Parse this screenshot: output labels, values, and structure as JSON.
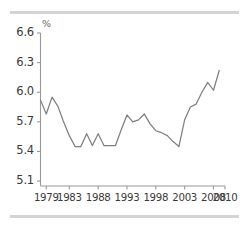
{
  "chart_data": {
    "type": "line",
    "title": "",
    "subtitle": "",
    "xlabel": "",
    "ylabel": "",
    "unit_label": "%",
    "grid": false,
    "legend": "none",
    "xlim": [
      1978,
      2010
    ],
    "ylim": [
      5.05,
      6.6
    ],
    "ytick_labels": [
      "6.6",
      "6.3",
      "6.0",
      "5.7",
      "5.4",
      "5.1"
    ],
    "ytick_values": [
      6.6,
      6.3,
      6.0,
      5.7,
      5.4,
      5.1
    ],
    "xtick_labels": [
      "1979",
      "1983",
      "1988",
      "1993",
      "1998",
      "2003",
      "2008",
      "2010"
    ],
    "xtick_values": [
      1979,
      1983,
      1988,
      1993,
      1998,
      2003,
      2008,
      2010
    ],
    "series": [
      {
        "name": "rate",
        "color": "#7f7f7f",
        "x": [
          1978,
          1979,
          1980,
          1981,
          1982,
          1983,
          1984,
          1985,
          1986,
          1987,
          1988,
          1989,
          1990,
          1991,
          1992,
          1993,
          1994,
          1995,
          1996,
          1997,
          1998,
          1999,
          2000,
          2001,
          2002,
          2003,
          2004,
          2005,
          2006,
          2007,
          2008,
          2009
        ],
        "values": [
          5.92,
          5.78,
          5.95,
          5.86,
          5.7,
          5.56,
          5.45,
          5.45,
          5.58,
          5.46,
          5.58,
          5.46,
          5.46,
          5.46,
          5.62,
          5.77,
          5.7,
          5.72,
          5.78,
          5.68,
          5.61,
          5.59,
          5.56,
          5.5,
          5.45,
          5.72,
          5.85,
          5.88,
          6.0,
          6.1,
          6.02,
          6.22
        ]
      }
    ]
  },
  "axes": {
    "y_axis_name": "y-axis",
    "x_axis_name": "x-axis"
  },
  "decorations": {
    "top_rule": "",
    "bottom_rule": ""
  }
}
